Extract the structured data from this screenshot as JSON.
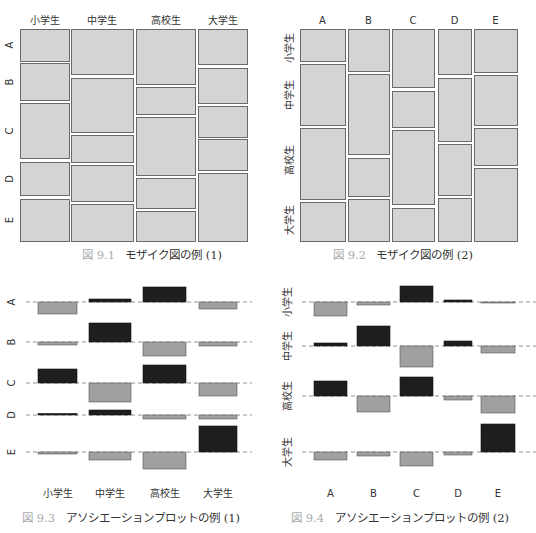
{
  "chart_data": [
    {
      "id": "fig-9-1",
      "type": "mosaic",
      "caption_number": "図 9.1",
      "caption": "モザイク図の例 (1)",
      "column_labels": [
        "小学生",
        "中学生",
        "高校生",
        "大学生"
      ],
      "row_labels": [
        "A",
        "B",
        "C",
        "D",
        "E"
      ],
      "columns": [
        {
          "label": "小学生",
          "x": [
            20,
            69
          ],
          "rows": [
            [
              29,
              61
            ],
            [
              63,
              100
            ],
            [
              103,
              158
            ],
            [
              162,
              195
            ],
            [
              199,
              241
            ]
          ]
        },
        {
          "label": "中学生",
          "x": [
            71,
            133
          ],
          "rows": [
            [
              29,
              74
            ],
            [
              78,
              132
            ],
            [
              135,
              162
            ],
            [
              165,
              201
            ],
            [
              204,
              241
            ]
          ]
        },
        {
          "label": "高校生",
          "x": [
            136,
            195
          ],
          "rows": [
            [
              29,
              84
            ],
            [
              87,
              114
            ],
            [
              117,
              175
            ],
            [
              178,
              208
            ],
            [
              211,
              241
            ]
          ]
        },
        {
          "label": "大学生",
          "x": [
            198,
            247
          ],
          "rows": [
            [
              29,
              64
            ],
            [
              68,
              103
            ],
            [
              106,
              137
            ],
            [
              139,
              170
            ],
            [
              173,
              241
            ]
          ]
        }
      ],
      "row_label_y": [
        45,
        82,
        131,
        179,
        220
      ]
    },
    {
      "id": "fig-9-2",
      "type": "mosaic",
      "caption_number": "図 9.2",
      "caption": "モザイク図の例 (2)",
      "column_labels": [
        "A",
        "B",
        "C",
        "D",
        "E"
      ],
      "row_labels": [
        "小学生",
        "中学生",
        "高校生",
        "大学生"
      ],
      "columns": [
        {
          "label": "A",
          "x": [
            300,
            345
          ],
          "rows": [
            [
              29,
              61
            ],
            [
              64,
              125
            ],
            [
              128,
              199
            ],
            [
              202,
              241
            ]
          ]
        },
        {
          "label": "B",
          "x": [
            348,
            389
          ],
          "rows": [
            [
              29,
              71
            ],
            [
              74,
              154
            ],
            [
              158,
              196
            ],
            [
              199,
              241
            ]
          ]
        },
        {
          "label": "C",
          "x": [
            392,
            434
          ],
          "rows": [
            [
              29,
              87
            ],
            [
              91,
              127
            ],
            [
              130,
              204
            ],
            [
              208,
              241
            ]
          ]
        },
        {
          "label": "D",
          "x": [
            438,
            471
          ],
          "rows": [
            [
              29,
              74
            ],
            [
              78,
              141
            ],
            [
              144,
              195
            ],
            [
              198,
              241
            ]
          ]
        },
        {
          "label": "E",
          "x": [
            474,
            517
          ],
          "rows": [
            [
              29,
              72
            ],
            [
              75,
              125
            ],
            [
              128,
              165
            ],
            [
              168,
              241
            ]
          ]
        }
      ],
      "row_label_y": [
        48,
        95,
        160,
        220
      ]
    },
    {
      "id": "fig-9-3",
      "type": "association",
      "caption_number": "図 9.3",
      "caption": "アソシエーションプロットの例 (1)",
      "column_labels": [
        "小学生",
        "中学生",
        "高校生",
        "大学生"
      ],
      "row_labels": [
        "A",
        "B",
        "C",
        "D",
        "E"
      ],
      "column_x": [
        [
          38,
          77
        ],
        [
          89,
          131
        ],
        [
          143,
          186
        ],
        [
          199,
          237
        ]
      ],
      "baselines_y": [
        302,
        342,
        383,
        415,
        452
      ],
      "residual_heights_px": [
        [
          -12,
          3,
          15,
          -7
        ],
        [
          -3,
          19,
          -14,
          -4
        ],
        [
          14,
          -19,
          18,
          -13
        ],
        [
          1.5,
          5,
          -4,
          -4
        ],
        [
          -2,
          -8,
          -17,
          26
        ]
      ],
      "note": "positive = dark bar above baseline, negative = gray bar below"
    },
    {
      "id": "fig-9-4",
      "type": "association",
      "caption_number": "図 9.4",
      "caption": "アソシエーションプロットの例 (2)",
      "column_labels": [
        "A",
        "B",
        "C",
        "D",
        "E"
      ],
      "row_labels": [
        "小学生",
        "中学生",
        "高校生",
        "大学生"
      ],
      "column_x": [
        [
          314,
          347
        ],
        [
          357,
          390
        ],
        [
          400,
          433
        ],
        [
          444,
          472
        ],
        [
          481,
          515
        ]
      ],
      "baselines_y": [
        302,
        346,
        396,
        452
      ],
      "residual_heights_px": [
        [
          -14,
          -3,
          16,
          2,
          -1
        ],
        [
          3,
          20,
          -21,
          5,
          -7
        ],
        [
          15,
          -16,
          19,
          -4,
          -17
        ],
        [
          -8,
          -4,
          -14,
          -3,
          28
        ]
      ],
      "note": "positive = dark bar above baseline, negative = gray bar below"
    }
  ],
  "colors": {
    "tile_fill": "#d4d4d4",
    "tile_stroke": "#6a6a6a",
    "positive_bar": "#1e1e1e",
    "negative_bar": "#a0a0a0",
    "baseline": "#777777"
  }
}
